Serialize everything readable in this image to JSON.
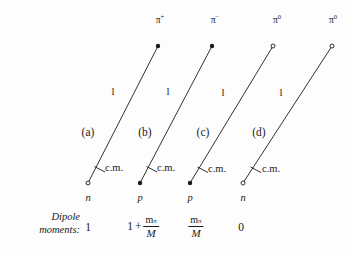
{
  "figure": {
    "caption_line1": "Dipole",
    "caption_line2": "moments:",
    "background_color": "#fdfdfd",
    "ink_color": "#1a1a1a"
  },
  "columns": [
    {
      "panel_label": "(a)",
      "pion_symbol": "π",
      "pion_charge": "+",
      "pion_marker": "filled-dot",
      "nucleon_label": "n",
      "nucleon_marker": "open-circle",
      "angular_momentum_label": "l",
      "cm_label": "c.m.",
      "moment_type": "integer",
      "moment_value": "1"
    },
    {
      "panel_label": "(b)",
      "pion_symbol": "π",
      "pion_charge": "−",
      "pion_marker": "filled-dot",
      "nucleon_label": "p",
      "nucleon_marker": "filled-dot",
      "angular_momentum_label": "l",
      "cm_label": "c.m.",
      "moment_type": "one-plus-fraction",
      "moment_leading": "1",
      "moment_operator": "+",
      "moment_numerator": "m",
      "moment_numerator_sub": "π",
      "moment_denominator": "M"
    },
    {
      "panel_label": "(c)",
      "pion_symbol": "π",
      "pion_charge": "0",
      "pion_marker": "open-circle",
      "nucleon_label": "p",
      "nucleon_marker": "filled-dot",
      "angular_momentum_label": "l",
      "cm_label": "c.m.",
      "moment_type": "fraction",
      "moment_numerator": "m",
      "moment_numerator_sub": "π",
      "moment_denominator": "M"
    },
    {
      "panel_label": "(d)",
      "pion_symbol": "π",
      "pion_charge": "0",
      "pion_marker": "open-circle",
      "nucleon_label": "n",
      "nucleon_marker": "open-circle",
      "angular_momentum_label": "l",
      "cm_label": "c.m.",
      "moment_type": "integer",
      "moment_value": "0"
    }
  ]
}
